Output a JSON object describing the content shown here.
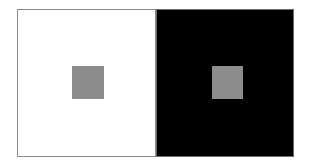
{
  "figure": {
    "type": "simultaneous-contrast-illusion",
    "panels": [
      {
        "name": "white-field",
        "background": "#ffffff",
        "square_color": "#8c8c8c"
      },
      {
        "name": "black-field",
        "background": "#000000",
        "square_color": "#8c8c8c"
      }
    ]
  }
}
